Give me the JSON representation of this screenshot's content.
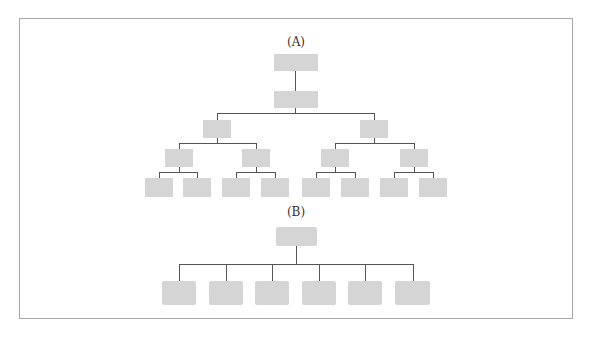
{
  "diagram": {
    "type": "org-chart-comparison",
    "frame_color": "#a8a8a8",
    "node_color": "#d5d5d5",
    "line_color": "#555555",
    "sections": [
      {
        "label": "(A)",
        "description": "Tall hierarchy: 1 root, 1 sub-root, 2 level-2 nodes, 4 level-3 nodes, 8 leaf nodes",
        "levels": [
          1,
          1,
          2,
          4,
          8
        ]
      },
      {
        "label": "(B)",
        "description": "Flat hierarchy: 1 root with 6 direct children",
        "levels": [
          1,
          6
        ]
      }
    ]
  }
}
